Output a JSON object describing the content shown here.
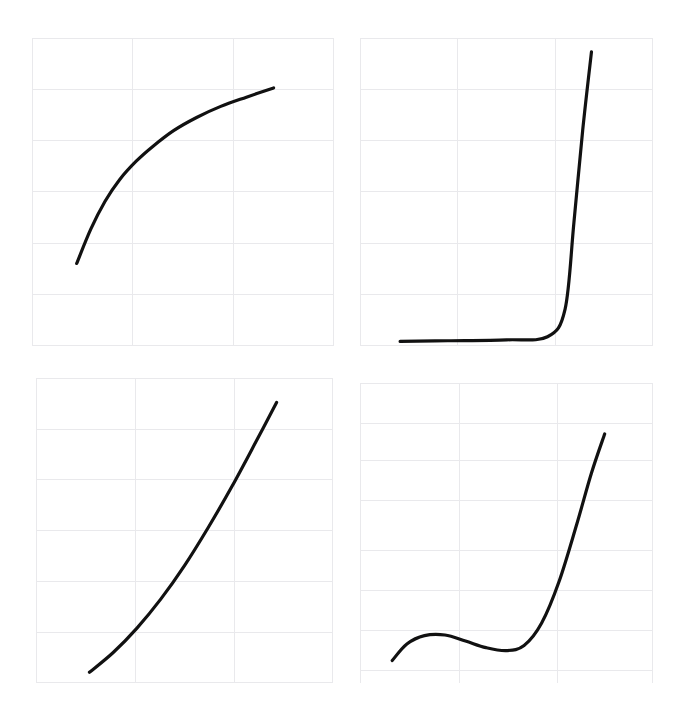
{
  "figure": {
    "title": "",
    "background_color": "#ffffff",
    "grid_color": "#e9e9ec",
    "curve_color": "#111111",
    "panel_count": 4,
    "layout": "2x2 grid of line plots"
  },
  "chart_data": [
    {
      "panel_id": "top-left",
      "panel_label": "",
      "type": "line",
      "title": "",
      "xlabel": "",
      "ylabel": "",
      "xlim": [
        0,
        1
      ],
      "ylim": [
        0,
        1
      ],
      "grid": true,
      "grid_x_ticks": [
        0,
        0.3333,
        0.6667,
        1
      ],
      "grid_y_ticks": [
        0,
        0.1667,
        0.3333,
        0.5,
        0.6667,
        0.8333,
        1
      ],
      "legend": null,
      "series": [
        {
          "name": "concave-increasing",
          "description": "steeply rising then flattening concave curve",
          "x": [
            0.148,
            0.195,
            0.242,
            0.29,
            0.345,
            0.4,
            0.47,
            0.545,
            0.625,
            0.71,
            0.8
          ],
          "y": [
            0.268,
            0.38,
            0.47,
            0.54,
            0.6,
            0.648,
            0.7,
            0.742,
            0.778,
            0.808,
            0.838
          ]
        }
      ]
    },
    {
      "panel_id": "top-right",
      "panel_label": "",
      "type": "line",
      "title": "",
      "xlabel": "",
      "ylabel": "",
      "xlim": [
        0,
        1
      ],
      "ylim": [
        0,
        1
      ],
      "grid": true,
      "grid_x_ticks": [
        0,
        0.3333,
        0.6667,
        1
      ],
      "grid_y_ticks": [
        0,
        0.1667,
        0.3333,
        0.5,
        0.6667,
        0.8333,
        1
      ],
      "legend": null,
      "series": [
        {
          "name": "hockey-stick",
          "description": "flat near zero then near-vertical rise",
          "x": [
            0.137,
            0.3,
            0.5,
            0.64,
            0.7,
            0.73,
            0.76,
            0.79
          ],
          "y": [
            0.015,
            0.017,
            0.02,
            0.03,
            0.12,
            0.4,
            0.7,
            0.955
          ]
        }
      ]
    },
    {
      "panel_id": "bottom-left",
      "panel_label": "",
      "type": "line",
      "title": "",
      "xlabel": "",
      "ylabel": "",
      "xlim": [
        0,
        1
      ],
      "ylim": [
        0,
        1
      ],
      "grid": true,
      "grid_x_ticks": [
        0,
        0.3333,
        0.6667,
        1
      ],
      "grid_y_ticks": [
        0,
        0.1667,
        0.3333,
        0.5,
        0.6667,
        0.8333,
        1
      ],
      "legend": null,
      "series": [
        {
          "name": "convex-increasing",
          "description": "smooth convex exponential-like rise",
          "x": [
            0.18,
            0.26,
            0.34,
            0.42,
            0.5,
            0.58,
            0.66,
            0.74,
            0.81
          ],
          "y": [
            0.035,
            0.1,
            0.18,
            0.275,
            0.385,
            0.51,
            0.645,
            0.79,
            0.92
          ]
        }
      ]
    },
    {
      "panel_id": "bottom-right",
      "panel_label": "",
      "type": "line",
      "title": "",
      "xlabel": "",
      "ylabel": "",
      "xlim": [
        0,
        1
      ],
      "ylim": [
        0,
        1
      ],
      "grid": true,
      "grid_x_ticks": [
        0,
        0.3333,
        0.6667,
        1
      ],
      "grid_y_ticks": [
        0,
        0.1667,
        0.3333,
        0.5,
        0.6667,
        0.8333,
        1
      ],
      "legend": null,
      "series": [
        {
          "name": "sigmoid-with-bump",
          "description": "rises to small local max, dips to local min, then steep rise",
          "x": [
            0.11,
            0.16,
            0.22,
            0.29,
            0.36,
            0.43,
            0.5,
            0.56,
            0.62,
            0.68,
            0.74,
            0.79,
            0.835
          ],
          "y": [
            0.075,
            0.13,
            0.158,
            0.16,
            0.14,
            0.118,
            0.108,
            0.125,
            0.2,
            0.34,
            0.53,
            0.7,
            0.83
          ]
        }
      ]
    }
  ]
}
